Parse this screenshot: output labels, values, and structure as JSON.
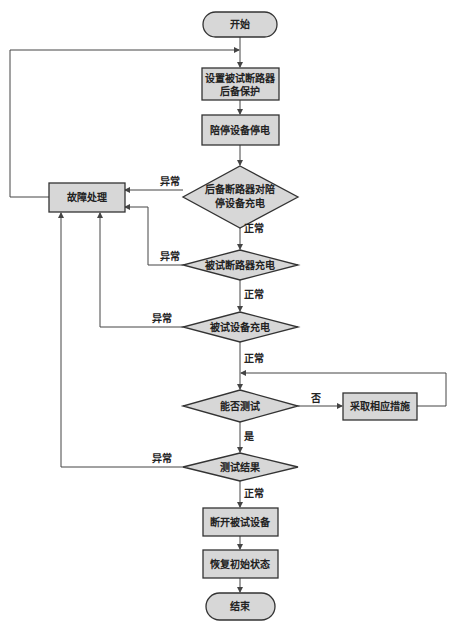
{
  "colors": {
    "node_fill": "#d7d7d7",
    "node_stroke": "#333333",
    "line": "#444444",
    "background": "#ffffff"
  },
  "nodes": {
    "start": {
      "label": "开始",
      "shape": "terminator"
    },
    "set_backup": {
      "label_line1": "设置被试断路器",
      "label_line2": "后备保护",
      "shape": "process"
    },
    "accompany_off": {
      "label": "陪停设备停电",
      "shape": "process"
    },
    "backup_charge": {
      "label_line1": "后备断路器对陪",
      "label_line2": "停设备充电",
      "shape": "decision"
    },
    "fault_handling": {
      "label": "故障处理",
      "shape": "process"
    },
    "breaker_charge": {
      "label": "被试断路器充电",
      "shape": "decision"
    },
    "device_charge": {
      "label": "被试设备充电",
      "shape": "decision"
    },
    "can_test": {
      "label": "能否测试",
      "shape": "decision"
    },
    "take_measures": {
      "label": "采取相应措施",
      "shape": "process"
    },
    "test_result": {
      "label": "测试结果",
      "shape": "decision"
    },
    "disconnect": {
      "label": "断开被试设备",
      "shape": "process"
    },
    "restore": {
      "label": "恢复初始状态",
      "shape": "process"
    },
    "end": {
      "label": "结束",
      "shape": "terminator"
    }
  },
  "edges": {
    "backup_abnormal": "异常",
    "backup_normal": "正常",
    "breaker_abnormal": "异常",
    "breaker_normal": "正常",
    "device_abnormal": "异常",
    "device_normal": "正常",
    "can_test_no": "否",
    "can_test_yes": "是",
    "result_abnormal": "异常",
    "result_normal": "正常"
  }
}
